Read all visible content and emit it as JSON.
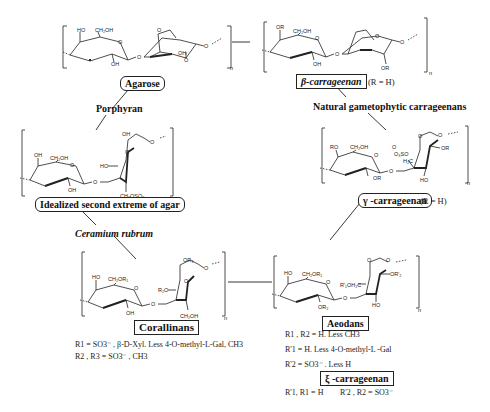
{
  "figure": {
    "nodes": {
      "agarose": {
        "label": "Agarose"
      },
      "beta_carrageenan": {
        "label": "β-carrageenan",
        "note": "(R = H)"
      },
      "idealized_agar": {
        "label": "Idealized second extreme of agar"
      },
      "gamma_carrageenan": {
        "label": "γ -carrageenan",
        "note": "(R = H)"
      },
      "corallinans": {
        "label": "Corallinans"
      },
      "aeodans": {
        "label": "Aeodans"
      },
      "xi_carrageenan": {
        "label": "ξ -carrageenan"
      }
    },
    "edges": {
      "porphyran": "Porphyran",
      "natural_gametophytic": "Natural gametophytic carrageenans",
      "ceramium": "Ceramium rubrum"
    },
    "structure_labels": {
      "agarose": [
        "HO",
        "CH2OH",
        "OH",
        "OH",
        "O",
        "O",
        "O",
        "O"
      ],
      "beta": [
        "OR",
        "CH2OH",
        "OH",
        "OR",
        "O",
        "O",
        "O"
      ],
      "idealized": [
        "OH",
        "CH2OH",
        "OH",
        "OH",
        "HO",
        "O",
        "CH2OSO3",
        "O"
      ],
      "gamma": [
        "RO",
        "CH2OH",
        "OR",
        "O3SO",
        "H2C",
        "OR",
        "HO",
        "O"
      ],
      "corallinans": [
        "HO",
        "CH2OR1",
        "OH",
        "OR3",
        "R2O",
        "CH2OH",
        "O"
      ],
      "aeodans": [
        "HO",
        "CH2OR1",
        "OR2",
        "R'1OH2C",
        "OR'2",
        "HO",
        "O"
      ]
    },
    "repeat_subscript": "n",
    "corallinans_notes": [
      "R1 = SO3⁻ , β-D-Xyl. Less 4-O-methyl-L-Gal, CH3",
      "R2 , R3 = SO3⁻ , CH3"
    ],
    "aeodans_notes": [
      "R1 , R2 = H. Less CH3",
      "R'1 = H. Less 4-O-methyl-L -Gal",
      "R'2 = SO3⁻ . Less H"
    ],
    "xi_notes": {
      "left": "R'1, R1 = H",
      "right": "R'2 , R2 = SO3⁻"
    }
  }
}
